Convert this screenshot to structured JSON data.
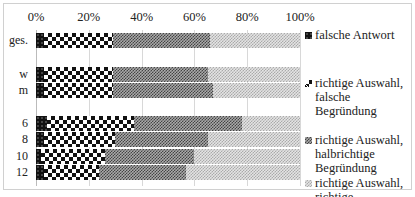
{
  "chart_data": {
    "type": "bar",
    "orientation": "horizontal",
    "stacked": true,
    "percent": true,
    "title": "",
    "xlabel": "",
    "ylabel": "",
    "xlim": [
      0,
      100
    ],
    "x_ticks": [
      "0%",
      "20%",
      "40%",
      "60%",
      "80%",
      "100%"
    ],
    "grid": true,
    "legend_position": "right",
    "categories": [
      "ges.",
      "w",
      "m",
      "6",
      "8",
      "10",
      "12"
    ],
    "series": [
      {
        "name": "falsche Antwort",
        "values": [
          3,
          3,
          3,
          4,
          3,
          2,
          3
        ]
      },
      {
        "name": "richtige Auswahl, falsche Begründung",
        "values": [
          26,
          26,
          26,
          33,
          27,
          24,
          21
        ]
      },
      {
        "name": "richtige Auswahl, halbrichtige Begründung",
        "values": [
          37,
          36,
          38,
          41,
          35,
          34,
          33
        ]
      },
      {
        "name": "richtige Auswahl, richtige Begründung",
        "values": [
          34,
          35,
          33,
          22,
          35,
          40,
          43
        ]
      }
    ]
  },
  "axis": {
    "ticks": [
      "0%",
      "20%",
      "40%",
      "60%",
      "80%",
      "100%"
    ]
  },
  "rows": [
    {
      "label": "ges."
    },
    {
      "label": "w"
    },
    {
      "label": "m"
    },
    {
      "label": "6"
    },
    {
      "label": "8"
    },
    {
      "label": "10"
    },
    {
      "label": "12"
    }
  ],
  "legend": {
    "items": [
      {
        "label": "falsche Antwort"
      },
      {
        "label": "richtige Auswahl,\nfalsche Begründung"
      },
      {
        "label": "richtige Auswahl,\nhalbrichtige\nBegründung"
      },
      {
        "label": "richtige Auswahl,\nrichtige Begründung"
      }
    ]
  }
}
